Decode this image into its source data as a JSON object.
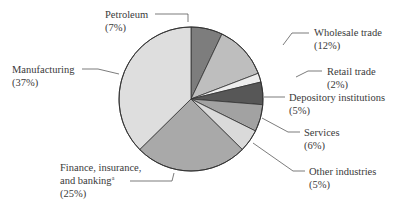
{
  "chart_data": {
    "type": "pie",
    "title": "",
    "start_angle_deg": 0,
    "direction": "clockwise",
    "center": [
      191,
      99
    ],
    "radius": 72,
    "slices": [
      {
        "label": "Petroleum",
        "pct_text": "(7%)",
        "value": 7,
        "color": "#7d7d7d",
        "label_pos": [
          105,
          18
        ],
        "leader": [
          [
            155,
            14
          ],
          [
            188,
            14
          ],
          [
            188,
            22
          ]
        ]
      },
      {
        "label": "Wholesale trade",
        "pct_text": "(12%)",
        "value": 12,
        "color": "#bebebe",
        "label_pos": [
          314,
          36
        ],
        "leader": [
          [
            309,
            33
          ],
          [
            292,
            33
          ],
          [
            283,
            45
          ]
        ]
      },
      {
        "label": "Retail trade",
        "pct_text": "(2%)",
        "value": 2,
        "color": "#ededed",
        "label_pos": [
          327,
          75
        ],
        "leader": [
          [
            322,
            71
          ],
          [
            308,
            71
          ],
          [
            296,
            77
          ]
        ]
      },
      {
        "label": "Depository institutions",
        "pct_text": "(5%)",
        "value": 5,
        "color": "#575757",
        "label_pos": [
          289,
          101
        ],
        "leader": [
          [
            285,
            97
          ],
          [
            264,
            97
          ]
        ]
      },
      {
        "label": "Services",
        "pct_text": "(6%)",
        "value": 6,
        "color": "#a2a2a2",
        "label_pos": [
          304,
          136
        ],
        "leader": [
          [
            300,
            132
          ],
          [
            288,
            132
          ],
          [
            262,
            118
          ]
        ]
      },
      {
        "label": "Other industries",
        "pct_text": "(5%)",
        "value": 5,
        "color": "#dadada",
        "label_pos": [
          309,
          175
        ],
        "leader": [
          [
            305,
            171
          ],
          [
            293,
            171
          ],
          [
            253,
            143
          ]
        ]
      },
      {
        "label": "Finance, insurance,",
        "label2": "and banking",
        "footnote": "a",
        "pct_text": "(25%)",
        "value": 25,
        "color": "#a9a9a9",
        "label_pos": [
          60,
          171
        ],
        "leader": [
          [
            130,
            181
          ],
          [
            172,
            181
          ],
          [
            174,
            173
          ]
        ]
      },
      {
        "label": "Manufacturing",
        "pct_text": "(37%)",
        "value": 37,
        "color": "#dedede",
        "label_pos": [
          12,
          73
        ],
        "leader": [
          [
            82,
            69
          ],
          [
            98,
            69
          ],
          [
            119,
            74
          ]
        ]
      }
    ]
  }
}
